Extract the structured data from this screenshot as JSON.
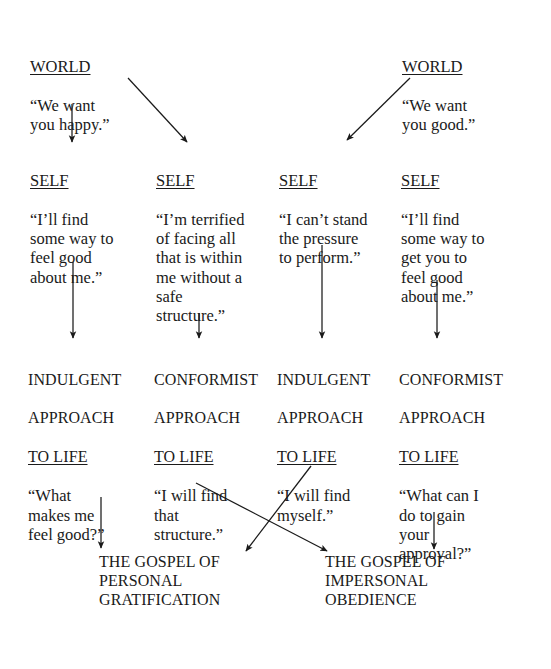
{
  "diagram": {
    "ink_color": "#1a1a1a",
    "background": "#ffffff",
    "rows": {
      "world_label": "WORLD",
      "self_label": "SELF",
      "approach_suffix": "APPROACH"
    },
    "world": [
      {
        "id": "world-left",
        "heading": "WORLD",
        "quote": "“We want\nyou happy.”"
      },
      {
        "id": "world-right",
        "heading": "WORLD",
        "quote": "“We want\nyou good.”"
      }
    ],
    "self": [
      {
        "id": "self-1",
        "heading": "SELF",
        "quote": "“I’ll find\nsome way to\nfeel good\nabout me.”"
      },
      {
        "id": "self-2",
        "heading": "SELF",
        "quote": "“I’m terrified\nof facing all\nthat is within\nme without a\nsafe\nstructure.”"
      },
      {
        "id": "self-3",
        "heading": "SELF",
        "quote": "“I can’t stand\nthe pressure\nto perform.”"
      },
      {
        "id": "self-4",
        "heading": "SELF",
        "quote": "“I’ll find\nsome way to\nget you to\nfeel good\nabout me.”"
      }
    ],
    "approach": [
      {
        "id": "approach-1",
        "line1": "INDULGENT",
        "line2": "APPROACH",
        "line3": "TO LIFE",
        "quote": "“What\nmakes me\nfeel good?”"
      },
      {
        "id": "approach-2",
        "line1": "CONFORMIST",
        "line2": "APPROACH",
        "line3": "TO LIFE",
        "quote": "“I will find\nthat\nstructure.”"
      },
      {
        "id": "approach-3",
        "line1": "INDULGENT",
        "line2": "APPROACH",
        "line3": "TO LIFE",
        "quote": "“I will find\nmyself.”"
      },
      {
        "id": "approach-4",
        "line1": "CONFORMIST",
        "line2": "APPROACH",
        "line3": "TO LIFE",
        "quote": "“What can I\ndo to gain\nyour\napproval?”"
      }
    ],
    "gospel": [
      {
        "id": "gospel-left",
        "text": "THE GOSPEL OF\nPERSONAL\nGRATIFICATION"
      },
      {
        "id": "gospel-right",
        "text": "THE GOSPEL OF\nIMPERSONAL\nOBEDIENCE"
      }
    ]
  }
}
